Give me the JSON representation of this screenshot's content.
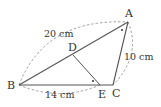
{
  "diagram": {
    "type": "geometry-triangle",
    "points": {
      "A": {
        "label": "A",
        "x": 128,
        "y": 22
      },
      "B": {
        "label": "B",
        "x": 19,
        "y": 85
      },
      "C": {
        "label": "C",
        "x": 113,
        "y": 85
      },
      "D": {
        "label": "D",
        "x": 73,
        "y": 55
      },
      "E": {
        "label": "E",
        "x": 100,
        "y": 85
      }
    },
    "measurements": {
      "AB": "20 cm",
      "AC": "10 cm",
      "BE": "14 cm"
    },
    "colors": {
      "line": "#555555",
      "dashed": "#888888",
      "text": "#333333"
    }
  }
}
